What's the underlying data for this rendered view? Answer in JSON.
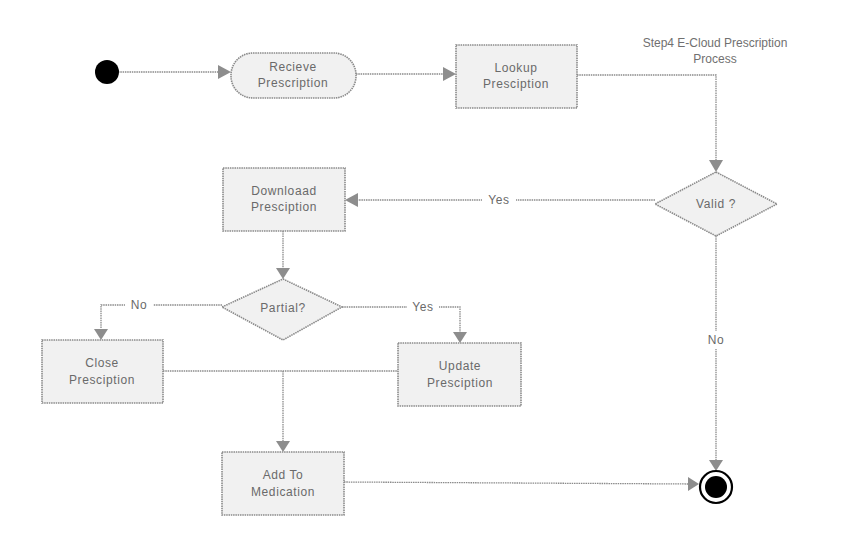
{
  "diagram": {
    "title_line1": "Step4 E-Cloud Prescription",
    "title_line2": "Process",
    "nodes": {
      "start": {
        "type": "initial"
      },
      "receive": {
        "line1": "Recieve",
        "line2": "Prescription"
      },
      "lookup": {
        "line1": "Lookup",
        "line2": "Presciption"
      },
      "valid": {
        "label": "Valid  ?"
      },
      "download": {
        "line1": "Downloaad",
        "line2": "Presciption"
      },
      "partial": {
        "label": "Partial?"
      },
      "close": {
        "line1": "Close",
        "line2": "Presciption"
      },
      "update": {
        "line1": "Update",
        "line2": "Presciption"
      },
      "add": {
        "line1": "Add To",
        "line2": "Medication"
      },
      "end": {
        "type": "final"
      }
    },
    "edges": {
      "valid_yes": "Yes",
      "valid_no": "No",
      "partial_no": "No",
      "partial_yes": "Yes"
    },
    "colors": {
      "node_fill": "#f1f1f1",
      "node_stroke": "#8a8a8a",
      "text": "#6a6a6a",
      "terminal": "#000000"
    }
  }
}
